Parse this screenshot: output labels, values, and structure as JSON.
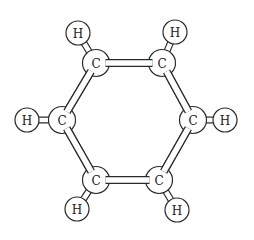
{
  "diagram": {
    "atoms": [
      {
        "id": "C1",
        "element": "C",
        "label": "C"
      },
      {
        "id": "C2",
        "element": "C",
        "label": "C"
      },
      {
        "id": "C3",
        "element": "C",
        "label": "C"
      },
      {
        "id": "C4",
        "element": "C",
        "label": "C"
      },
      {
        "id": "C5",
        "element": "C",
        "label": "C"
      },
      {
        "id": "C6",
        "element": "C",
        "label": "C"
      },
      {
        "id": "H1",
        "element": "H",
        "label": "H"
      },
      {
        "id": "H2",
        "element": "H",
        "label": "H"
      },
      {
        "id": "H3",
        "element": "H",
        "label": "H"
      },
      {
        "id": "H4",
        "element": "H",
        "label": "H"
      },
      {
        "id": "H5",
        "element": "H",
        "label": "H"
      },
      {
        "id": "H6",
        "element": "H",
        "label": "H"
      }
    ],
    "bonds": [
      {
        "from": "C1",
        "to": "C2",
        "type": "carbon-carbon"
      },
      {
        "from": "C2",
        "to": "C3",
        "type": "carbon-carbon"
      },
      {
        "from": "C3",
        "to": "C4",
        "type": "carbon-carbon"
      },
      {
        "from": "C4",
        "to": "C5",
        "type": "carbon-carbon"
      },
      {
        "from": "C5",
        "to": "C6",
        "type": "carbon-carbon"
      },
      {
        "from": "C6",
        "to": "C1",
        "type": "carbon-carbon"
      },
      {
        "from": "C1",
        "to": "H1",
        "type": "carbon-hydrogen"
      },
      {
        "from": "C2",
        "to": "H2",
        "type": "carbon-hydrogen"
      },
      {
        "from": "C3",
        "to": "H3",
        "type": "carbon-hydrogen"
      },
      {
        "from": "C4",
        "to": "H4",
        "type": "carbon-hydrogen"
      },
      {
        "from": "C5",
        "to": "H5",
        "type": "carbon-hydrogen"
      },
      {
        "from": "C6",
        "to": "H6",
        "type": "carbon-hydrogen"
      }
    ]
  }
}
